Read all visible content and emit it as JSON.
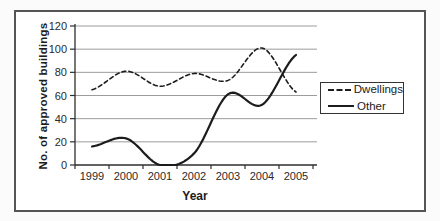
{
  "chart_data": {
    "type": "line",
    "title": "",
    "categories": [
      "1999",
      "2000",
      "2001",
      "2002",
      "2003",
      "2004",
      "2005"
    ],
    "series": [
      {
        "name": "Dwellings",
        "values": [
          65,
          81,
          68,
          79,
          73,
          101,
          63
        ],
        "line_style": "dashed",
        "color": "#1c1c1c"
      },
      {
        "name": "Other",
        "values": [
          16,
          23,
          0,
          10,
          61,
          52,
          95
        ],
        "line_style": "solid",
        "color": "#1c1c1c"
      }
    ],
    "xlabel": "Year",
    "ylabel": "No. of approved buildings",
    "ylim": [
      0,
      120
    ],
    "yticks": [
      0,
      20,
      40,
      60,
      80,
      100,
      120
    ],
    "grid": "horizontal",
    "smooth": true,
    "legend_position": "right"
  },
  "styles": {
    "grid_color": "#9c9c9c",
    "axis_color": "#2e2e2e",
    "tick_label_color": "#2a2a2a",
    "frame_border_color": "#555555",
    "background": "#ffffff"
  }
}
